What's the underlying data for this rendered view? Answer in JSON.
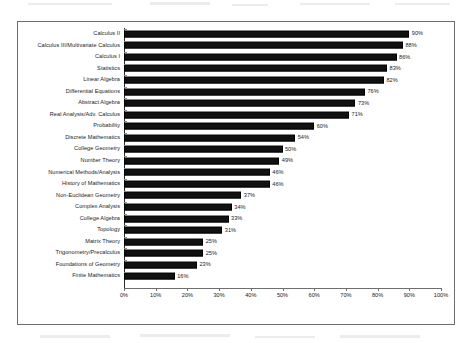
{
  "chart_data": {
    "type": "bar",
    "orientation": "horizontal",
    "title": "",
    "xlabel": "",
    "ylabel": "",
    "xlim": [
      0,
      100
    ],
    "grid": false,
    "legend": null,
    "value_label_suffix": "%",
    "bar_color": "#111111",
    "frame_color": "#6e6e6e",
    "axis_color": "#2a2a2a",
    "xticks": [
      0,
      10,
      20,
      30,
      40,
      50,
      60,
      70,
      80,
      90,
      100
    ],
    "xtick_labels": [
      "0%",
      "10%",
      "20%",
      "30%",
      "40%",
      "50%",
      "60%",
      "70%",
      "80%",
      "90%",
      "100%"
    ],
    "categories": [
      "Calculus II",
      "Calculus III/Multivariate Calculus",
      "Calculus I",
      "Statistics",
      "Linear Algebra",
      "Differential Equations",
      "Abstract Algebra",
      "Real Analysis/Adv. Calculus",
      "Probability",
      "Discrete Mathematics",
      "College Geometry",
      "Number Theory",
      "Numerical Methods/Analysis",
      "History of Mathematics",
      "Non-Euclidean Geometry",
      "Complex Analysis",
      "College Algebra",
      "Topology",
      "Matrix Theory",
      "Trigonometry/Precalculus",
      "Foundations of Geometry",
      "Finite Mathematics"
    ],
    "values": [
      90,
      88,
      86,
      83,
      82,
      76,
      73,
      71,
      60,
      54,
      50,
      49,
      46,
      46,
      37,
      34,
      33,
      31,
      25,
      25,
      23,
      16
    ],
    "value_labels": [
      "90%",
      "88%",
      "86%",
      "83%",
      "82%",
      "76%",
      "73%",
      "71%",
      "60%",
      "54%",
      "50%",
      "49%",
      "46%",
      "46%",
      "37%",
      "34%",
      "33%",
      "31%",
      "25%",
      "25%",
      "23%",
      "16%"
    ]
  }
}
